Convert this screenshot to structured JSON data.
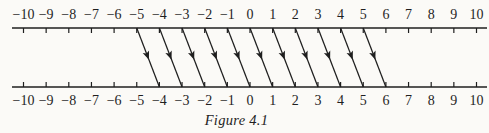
{
  "figure": {
    "caption": "Figure 4.1",
    "ink_color": "#1f1f1f",
    "paper_color": "#fbfaf7"
  },
  "chart_data": {
    "type": "diagram",
    "subtype": "number-line-mapping",
    "top_axis": {
      "min": -10,
      "max": 10,
      "step": 1,
      "tick_labels": [
        "−10",
        "−9",
        "−8",
        "−7",
        "−6",
        "−5",
        "−4",
        "−3",
        "−2",
        "−1",
        "0",
        "1",
        "2",
        "3",
        "4",
        "5",
        "6",
        "7",
        "8",
        "9",
        "10"
      ]
    },
    "bottom_axis": {
      "min": -10,
      "max": 10,
      "step": 1,
      "tick_labels": [
        "−10",
        "−9",
        "−8",
        "−7",
        "−6",
        "−5",
        "−4",
        "−3",
        "−2",
        "−1",
        "0",
        "1",
        "2",
        "3",
        "4",
        "5",
        "6",
        "7",
        "8",
        "9",
        "10"
      ]
    },
    "arrows": [
      {
        "from": -5,
        "to": -4
      },
      {
        "from": -4,
        "to": -3
      },
      {
        "from": -3,
        "to": -2
      },
      {
        "from": -2,
        "to": -1
      },
      {
        "from": -1,
        "to": 0
      },
      {
        "from": 0,
        "to": 1
      },
      {
        "from": 1,
        "to": 2
      },
      {
        "from": 2,
        "to": 3
      },
      {
        "from": 3,
        "to": 4
      },
      {
        "from": 4,
        "to": 5
      },
      {
        "from": 5,
        "to": 6
      }
    ]
  }
}
